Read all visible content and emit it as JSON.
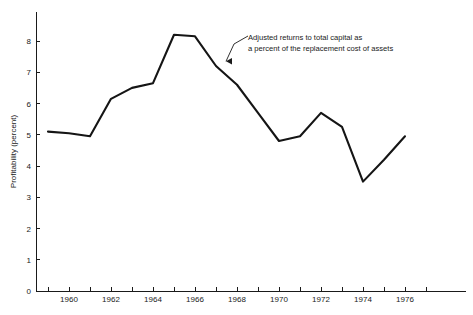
{
  "chart_data": {
    "type": "line",
    "title": "",
    "subtitle": "",
    "xlabel": "",
    "ylabel": "Profitability (percent)",
    "xlim": [
      1959,
      1977
    ],
    "ylim": [
      0,
      8.6
    ],
    "grid": false,
    "legend_position": "none",
    "x": [
      1959,
      1960,
      1961,
      1962,
      1963,
      1964,
      1965,
      1966,
      1967,
      1968,
      1969,
      1970,
      1971,
      1972,
      1973,
      1974,
      1975,
      1976
    ],
    "values": [
      5.1,
      5.05,
      4.95,
      6.15,
      6.5,
      6.65,
      8.2,
      8.15,
      7.2,
      6.6,
      5.7,
      4.8,
      4.95,
      5.7,
      5.25,
      3.5,
      4.2,
      4.95
    ],
    "series": [
      {
        "name": "Adjusted returns to total capital as a percent of the replacement cost of assets",
        "values": [
          5.1,
          5.05,
          4.95,
          6.15,
          6.5,
          6.65,
          8.2,
          8.15,
          7.2,
          6.6,
          5.7,
          4.8,
          4.95,
          5.7,
          5.25,
          3.5,
          4.2,
          4.95
        ]
      }
    ],
    "y_ticks": [
      0,
      1,
      2,
      3,
      4,
      5,
      6,
      7,
      8
    ],
    "y_tick_labels": [
      "0",
      "1",
      "2",
      "3",
      "4",
      "5",
      "6",
      "7",
      "8"
    ],
    "x_ticks": [
      1959,
      1960,
      1961,
      1962,
      1963,
      1964,
      1965,
      1966,
      1967,
      1968,
      1969,
      1970,
      1971,
      1972,
      1973,
      1974,
      1975,
      1976,
      1977
    ],
    "x_tick_labels": [
      "",
      "1960",
      "",
      "1962",
      "",
      "1964",
      "",
      "1966",
      "",
      "1968",
      "",
      "1970",
      "",
      "1972",
      "",
      "1974",
      "",
      "1976",
      ""
    ],
    "annotations": [
      {
        "line1": "Adjusted returns to total capital as",
        "line2": "a percent of the replacement cost of assets",
        "target_x": 1967.0,
        "target_y": 7.35
      }
    ],
    "colors": {
      "line": "#151515",
      "axis": "#1a1a1a",
      "text": "#1a1a1a",
      "background": "#ffffff"
    }
  }
}
